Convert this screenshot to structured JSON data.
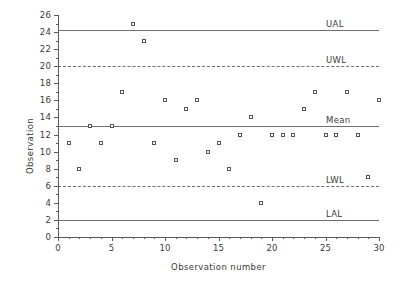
{
  "chart_data": {
    "type": "scatter",
    "title": "",
    "xlabel": "Observation number",
    "ylabel": "Observation",
    "xlim": [
      0,
      30
    ],
    "ylim": [
      0,
      26
    ],
    "grid": false,
    "legend": "none",
    "x_ticks": [
      0,
      5,
      10,
      15,
      20,
      25,
      30
    ],
    "x_tick_labels": [
      "0",
      "5",
      "10",
      "15",
      "20",
      "25",
      "30"
    ],
    "x_minor_tick_step": 1,
    "y_ticks": [
      0,
      2,
      4,
      6,
      8,
      10,
      12,
      14,
      16,
      18,
      20,
      22,
      24,
      26
    ],
    "y_tick_labels": [
      "0",
      "2",
      "4",
      "6",
      "8",
      "10",
      "12",
      "14",
      "16",
      "18",
      "20",
      "22",
      "24",
      "26"
    ],
    "y_minor_tick_step": 1,
    "x": [
      1,
      2,
      3,
      4,
      5,
      6,
      7,
      8,
      9,
      10,
      11,
      12,
      13,
      14,
      15,
      16,
      17,
      18,
      19,
      20,
      21,
      22,
      23,
      24,
      25,
      26,
      27,
      28,
      29,
      30
    ],
    "values": [
      11,
      8,
      13,
      11,
      13,
      17,
      25,
      23,
      11,
      16,
      9,
      15,
      16,
      10,
      11,
      8,
      12,
      14,
      4,
      12,
      12,
      12,
      15,
      17,
      12,
      12,
      17,
      12,
      7,
      16
    ],
    "marker": "open-square",
    "reference_lines": [
      {
        "label": "UAL",
        "value": 24.2,
        "style": "solid"
      },
      {
        "label": "UWL",
        "value": 20,
        "style": "dashed"
      },
      {
        "label": "Mean",
        "value": 13,
        "style": "solid"
      },
      {
        "label": "LWL",
        "value": 6,
        "style": "dashed"
      },
      {
        "label": "LAL",
        "value": 2,
        "style": "solid"
      }
    ]
  }
}
